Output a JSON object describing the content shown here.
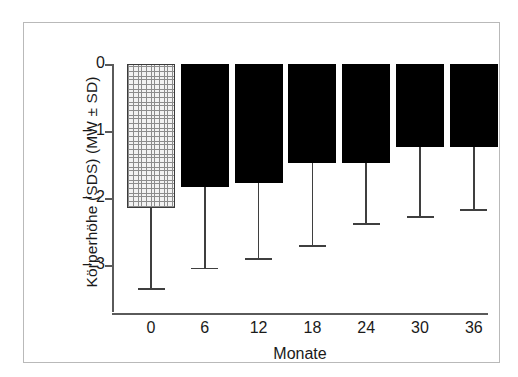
{
  "chart_data": {
    "type": "bar",
    "title": "",
    "subtitle": "",
    "xlabel": "Monate",
    "ylabel": "Körperhöhe (SDS) (MW ± SD)",
    "categories": [
      "0",
      "6",
      "12",
      "18",
      "24",
      "30",
      "36"
    ],
    "values": [
      -2.15,
      -1.84,
      -1.78,
      -1.48,
      -1.48,
      -1.24,
      -1.24
    ],
    "errors_lower": [
      -3.34,
      -3.04,
      -2.9,
      -2.7,
      -2.37,
      -2.27,
      -2.16
    ],
    "sd": [
      1.19,
      1.2,
      1.12,
      1.22,
      0.89,
      1.03,
      0.92
    ],
    "ylim": [
      -3.55,
      0
    ],
    "yticks": [
      0,
      -1,
      -2,
      -3
    ],
    "ytick_labels": [
      "0",
      "– 1",
      "– 2",
      "– 3"
    ],
    "grid": false,
    "legend": false,
    "bar_styles": [
      "stipple",
      "solid",
      "solid",
      "solid",
      "solid",
      "solid",
      "solid"
    ],
    "colors": {
      "solid_bar": "#000000",
      "stipple_bar_fill": "#f2f2f2",
      "stipple_bar_hatch": "#8c8c8c",
      "axis": "#5a5a5a",
      "error_bar": "#3f3f3f",
      "frame": "#b9b9b9",
      "background": "#ffffff",
      "text": "#1a1a1a"
    }
  }
}
